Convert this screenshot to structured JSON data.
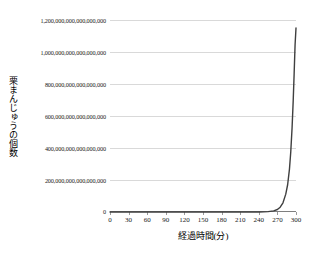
{
  "chart_data": {
    "type": "line",
    "title": "",
    "xlabel": "経過時間(分)",
    "ylabel": "栗まんじゅうの個数",
    "xlim": [
      0,
      300
    ],
    "ylim": [
      0,
      1200000000000000000
    ],
    "grid": true,
    "legend": false,
    "x_ticks": [
      0,
      30,
      60,
      90,
      120,
      150,
      180,
      210,
      240,
      270,
      300
    ],
    "x_tick_labels": [
      "0",
      "30",
      "60",
      "90",
      "120",
      "150",
      "180",
      "210",
      "240",
      "270",
      "300"
    ],
    "y_ticks": [
      0,
      200000000000000000,
      400000000000000000,
      600000000000000000,
      800000000000000000,
      1000000000000000000,
      1200000000000000000
    ],
    "y_tick_labels": [
      "0",
      "200,000,000,000,000,000",
      "400,000,000,000,000,000",
      "600,000,000,000,000,000",
      "800,000,000,000,000,000",
      "1,000,000,000,000,000,000",
      "1,200,000,000,000,000,000"
    ],
    "series": [
      {
        "name": "栗まんじゅうの個数",
        "color": "#3f3f3f",
        "x": [
          0,
          30,
          60,
          90,
          120,
          150,
          180,
          210,
          240,
          255,
          270,
          275,
          280,
          285,
          290,
          292,
          294,
          296,
          298,
          300
        ],
        "values": [
          1,
          1024,
          1048576,
          1073741824,
          1099511627776,
          1125899906842624,
          1152921504606847000,
          1180591620717411000,
          1208925819614629000,
          1237940039285380000,
          1267650600228229000,
          8000000000000000,
          20000000000000000,
          55000000000000000,
          150000000000000000,
          260000000000000000,
          430000000000000000,
          650000000000000000,
          900000000000000000,
          1150000000000000000
        ]
      }
    ],
    "curve_points_normalized": [
      [
        0.0,
        0.0
      ],
      [
        0.1,
        0.0
      ],
      [
        0.2,
        0.0
      ],
      [
        0.3,
        0.0
      ],
      [
        0.4,
        0.0
      ],
      [
        0.5,
        0.0
      ],
      [
        0.6,
        0.0
      ],
      [
        0.7,
        0.0
      ],
      [
        0.8,
        0.0
      ],
      [
        0.85,
        0.002
      ],
      [
        0.88,
        0.006
      ],
      [
        0.9,
        0.013
      ],
      [
        0.915,
        0.025
      ],
      [
        0.93,
        0.048
      ],
      [
        0.945,
        0.093
      ],
      [
        0.955,
        0.142
      ],
      [
        0.965,
        0.225
      ],
      [
        0.972,
        0.315
      ],
      [
        0.979,
        0.44
      ],
      [
        0.985,
        0.58
      ],
      [
        0.99,
        0.72
      ],
      [
        0.995,
        0.87
      ],
      [
        1.0,
        0.958
      ]
    ],
    "peak_value_label": "約1,150,000,000,000,000,000"
  },
  "axes": {
    "y_title": "栗まんじゅうの個数",
    "x_title": "経過時間(分)"
  },
  "style": {
    "curve_color": "#3f3f3f",
    "grid_color": "#d9d9d9",
    "axis_color": "#7f7f7f",
    "background": "#ffffff",
    "text_color": "#1a1a1a"
  }
}
